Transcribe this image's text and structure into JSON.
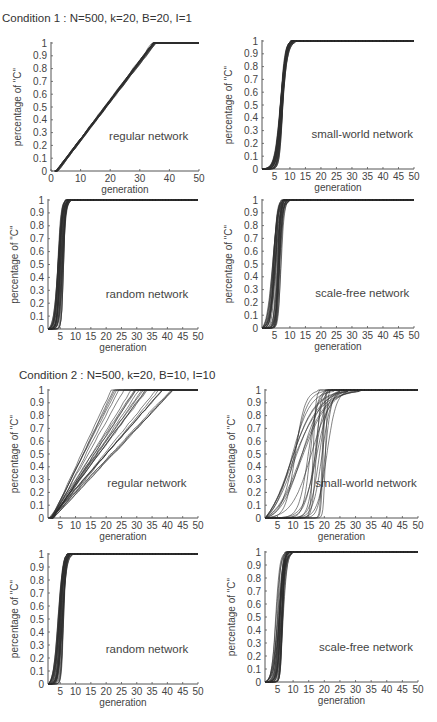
{
  "conditions": [
    {
      "title": "Condition 1 : N=500, k=20, B=20, I=1"
    },
    {
      "title": "Condition 2 : N=500, k=20, B=10, I=10"
    }
  ],
  "chart_data": [
    {
      "type": "line",
      "condition": 1,
      "title": "regular network",
      "xlabel": "generation",
      "ylabel": "percentage of \"C\"",
      "xlim": [
        0,
        50
      ],
      "ylim": [
        0,
        1
      ],
      "xticks": [
        0,
        10,
        20,
        30,
        40,
        50
      ],
      "yticks": [
        0,
        0.1,
        0.2,
        0.3,
        0.4,
        0.5,
        0.6,
        0.7,
        0.8,
        0.9,
        1
      ],
      "ytick_labels": [
        "0",
        "0.1",
        "0.2",
        "0.3",
        "0.4",
        "0.5",
        "0.6",
        "0.7",
        "0.8",
        "0.9",
        "1"
      ],
      "series_model": {
        "kind": "linear",
        "runs": 20,
        "start_range": [
          1.5,
          2.5
        ],
        "end_range": [
          34,
          35.5
        ]
      },
      "grid": false
    },
    {
      "type": "line",
      "condition": 1,
      "title": "small-world network",
      "xlabel": "generation",
      "ylabel": "percentage of \"C\"",
      "xlim": [
        1,
        50
      ],
      "ylim": [
        0,
        1
      ],
      "xticks": [
        5,
        10,
        15,
        20,
        25,
        30,
        35,
        40,
        45,
        50
      ],
      "yticks": [
        0,
        0.1,
        0.2,
        0.3,
        0.4,
        0.5,
        0.6,
        0.7,
        0.8,
        0.9,
        1
      ],
      "ytick_labels": [
        "0",
        "0.1",
        "0.2",
        "0.3",
        "0.4",
        "0.5",
        "0.6",
        "0.7",
        "0.8",
        "0.9",
        "1"
      ],
      "series_model": {
        "kind": "sigmoid",
        "runs": 30,
        "midpoint_range": [
          6.8,
          7.8
        ],
        "saturate_range": [
          10,
          12
        ]
      },
      "grid": false
    },
    {
      "type": "line",
      "condition": 1,
      "title": "random network",
      "xlabel": "generation",
      "ylabel": "percentage of \"C\"",
      "xlim": [
        1,
        50
      ],
      "ylim": [
        0,
        1
      ],
      "xticks": [
        5,
        10,
        15,
        20,
        25,
        30,
        35,
        40,
        45,
        50
      ],
      "yticks": [
        0,
        0.1,
        0.2,
        0.3,
        0.4,
        0.5,
        0.6,
        0.7,
        0.8,
        0.9,
        1
      ],
      "ytick_labels": [
        "0",
        "0.1",
        "0.2",
        "0.3",
        "0.4",
        "0.5",
        "0.6",
        "0.7",
        "0.8",
        "0.9",
        "1"
      ],
      "series_model": {
        "kind": "sigmoid",
        "runs": 30,
        "midpoint_range": [
          4.2,
          6.3
        ],
        "saturate_range": [
          6.5,
          8.5
        ]
      },
      "grid": false
    },
    {
      "type": "line",
      "condition": 1,
      "title": "scale-free network",
      "xlabel": "generation",
      "ylabel": "percentage of \"C\"",
      "xlim": [
        1,
        50
      ],
      "ylim": [
        0,
        1
      ],
      "xticks": [
        5,
        10,
        15,
        20,
        25,
        30,
        35,
        40,
        45,
        50
      ],
      "yticks": [
        0,
        0.1,
        0.2,
        0.3,
        0.4,
        0.5,
        0.6,
        0.7,
        0.8,
        0.9,
        1
      ],
      "ytick_labels": [
        "0",
        "0.1",
        "0.2",
        "0.3",
        "0.4",
        "0.5",
        "0.6",
        "0.7",
        "0.8",
        "0.9",
        "1"
      ],
      "series_model": {
        "kind": "sigmoid",
        "runs": 30,
        "midpoint_range": [
          4.3,
          7.3
        ],
        "saturate_range": [
          7,
          10
        ]
      },
      "grid": false
    },
    {
      "type": "line",
      "condition": 2,
      "title": "regular network",
      "xlabel": "generation",
      "ylabel": "percentage of \"C\"",
      "xlim": [
        1,
        50
      ],
      "ylim": [
        0,
        1
      ],
      "xticks": [
        5,
        10,
        15,
        20,
        25,
        30,
        35,
        40,
        45,
        50
      ],
      "yticks": [
        0,
        0.1,
        0.2,
        0.3,
        0.4,
        0.5,
        0.6,
        0.7,
        0.8,
        0.9,
        1
      ],
      "ytick_labels": [
        "0",
        "0.1",
        "0.2",
        "0.3",
        "0.4",
        "0.5",
        "0.6",
        "0.7",
        "0.8",
        "0.9",
        "1"
      ],
      "series_model": {
        "kind": "linear",
        "runs": 25,
        "start_range": [
          1.5,
          3
        ],
        "end_range": [
          20,
          42
        ]
      },
      "grid": false
    },
    {
      "type": "line",
      "condition": 2,
      "title": "small-world network",
      "xlabel": "generation",
      "ylabel": "percentage of \"C\"",
      "xlim": [
        1,
        50
      ],
      "ylim": [
        0,
        1
      ],
      "xticks": [
        5,
        10,
        15,
        20,
        25,
        30,
        35,
        40,
        45,
        50
      ],
      "yticks": [
        0,
        0.1,
        0.2,
        0.3,
        0.4,
        0.5,
        0.6,
        0.7,
        0.8,
        0.9,
        1
      ],
      "ytick_labels": [
        "0",
        "0.1",
        "0.2",
        "0.3",
        "0.4",
        "0.5",
        "0.6",
        "0.7",
        "0.8",
        "0.9",
        "1"
      ],
      "series_model": {
        "kind": "sigmoid",
        "runs": 25,
        "midpoint_range": [
          9,
          21
        ],
        "saturate_range": [
          16,
          32
        ]
      },
      "grid": false
    },
    {
      "type": "line",
      "condition": 2,
      "title": "random network",
      "xlabel": "generation",
      "ylabel": "percentage of \"C\"",
      "xlim": [
        1,
        50
      ],
      "ylim": [
        0,
        1
      ],
      "xticks": [
        5,
        10,
        15,
        20,
        25,
        30,
        35,
        40,
        45,
        50
      ],
      "yticks": [
        0,
        0.1,
        0.2,
        0.3,
        0.4,
        0.5,
        0.6,
        0.7,
        0.8,
        0.9,
        1
      ],
      "ytick_labels": [
        "0",
        "0.1",
        "0.2",
        "0.3",
        "0.4",
        "0.5",
        "0.6",
        "0.7",
        "0.8",
        "0.9",
        "1"
      ],
      "series_model": {
        "kind": "sigmoid",
        "runs": 30,
        "midpoint_range": [
          4.2,
          6.2
        ],
        "saturate_range": [
          7,
          9
        ]
      },
      "grid": false
    },
    {
      "type": "line",
      "condition": 2,
      "title": "scale-free network",
      "xlabel": "generation",
      "ylabel": "percentage of \"C\"",
      "xlim": [
        1,
        50
      ],
      "ylim": [
        0,
        1
      ],
      "xticks": [
        5,
        10,
        15,
        20,
        25,
        30,
        35,
        40,
        45,
        50
      ],
      "yticks": [
        0,
        0.1,
        0.2,
        0.3,
        0.4,
        0.5,
        0.6,
        0.7,
        0.8,
        0.9,
        1
      ],
      "ytick_labels": [
        "0",
        "0.1",
        "0.2",
        "0.3",
        "0.4",
        "0.5",
        "0.6",
        "0.7",
        "0.8",
        "0.9",
        "1"
      ],
      "series_model": {
        "kind": "sigmoid",
        "runs": 30,
        "midpoint_range": [
          4.3,
          7
        ],
        "saturate_range": [
          7,
          10
        ]
      },
      "grid": false
    }
  ]
}
